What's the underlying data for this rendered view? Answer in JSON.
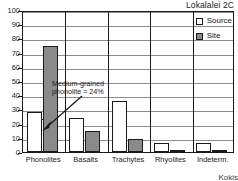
{
  "chart_data": {
    "type": "bar",
    "title": "Lokalalei 2C",
    "xlabel": "",
    "ylabel": "",
    "ylim": [
      0,
      100
    ],
    "yticks": [
      0,
      10,
      20,
      30,
      40,
      50,
      60,
      70,
      80,
      90,
      100
    ],
    "grid": true,
    "legend_position": "top-right",
    "categories": [
      "Phonolites",
      "Basalts",
      "Trachytes",
      "Rhyolites",
      "Indeterm."
    ],
    "series": [
      {
        "name": "Source",
        "values": [
          28,
          24,
          36,
          6,
          6
        ]
      },
      {
        "name": "Site",
        "values": [
          75,
          14.5,
          9,
          1,
          1
        ]
      }
    ],
    "extra_bars": [
      {
        "category": "Phonolites",
        "series": "Source",
        "value": 23,
        "note": "medium-grained phonolite sub-bar"
      }
    ],
    "annotations": [
      {
        "text_line1": "Medium-grained",
        "text_line2": "phonolite = 24%",
        "points_to": "Phonolites"
      }
    ],
    "credit": "Kokis"
  },
  "legend": {
    "items": [
      {
        "label": "Source",
        "swatch": "open-square",
        "color": "#ffffff"
      },
      {
        "label": "Site",
        "swatch": "filled-square",
        "color": "#8a8a8a"
      }
    ]
  },
  "colors": {
    "source_fill": "#ffffff",
    "site_fill": "#8a8a8a",
    "axis": "#1a1a1a",
    "grid": "#8c8c8c"
  }
}
